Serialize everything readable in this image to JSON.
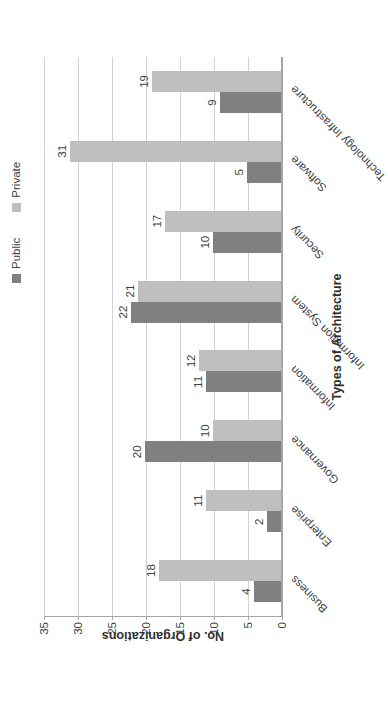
{
  "chart_data": {
    "type": "bar",
    "title": "",
    "xlabel": "Types of Architecture",
    "ylabel": "No. of Organizations",
    "ylim": [
      0,
      35
    ],
    "yticks": [
      0,
      5,
      10,
      15,
      20,
      25,
      30,
      35
    ],
    "grid": true,
    "legend_position": "top-right",
    "orientation": "vertical-grouped",
    "rotation_note": "entire figure rendered rotated 90 degrees counter-clockwise in the source image",
    "categories": [
      "Business",
      "Enterprise",
      "Governance",
      "Information",
      "Information System",
      "Security",
      "Software",
      "Technology Infrastructure"
    ],
    "series": [
      {
        "name": "Public",
        "color": "#808080",
        "values": [
          4,
          2,
          20,
          11,
          22,
          10,
          5,
          9
        ]
      },
      {
        "name": "Private",
        "color": "#bfbfbf",
        "values": [
          18,
          11,
          10,
          12,
          21,
          17,
          31,
          19
        ]
      }
    ]
  },
  "legend": {
    "entries": [
      {
        "label": "Public",
        "color": "#808080",
        "marker": "square-swatch"
      },
      {
        "label": "Private",
        "color": "#bfbfbf",
        "marker": "square-swatch"
      }
    ]
  },
  "axes": {
    "y_title": "No. of Organizations",
    "x_title": "Types of Architecture",
    "y_tick_labels": [
      "0",
      "5",
      "10",
      "15",
      "20",
      "25",
      "30",
      "35"
    ]
  },
  "colors": {
    "public": "#808080",
    "private": "#bfbfbf",
    "gridline": "#d2d2d2",
    "axis": "#a6a6a6",
    "text": "#404040",
    "title_text": "#2f2f2f",
    "background": "#ffffff"
  }
}
